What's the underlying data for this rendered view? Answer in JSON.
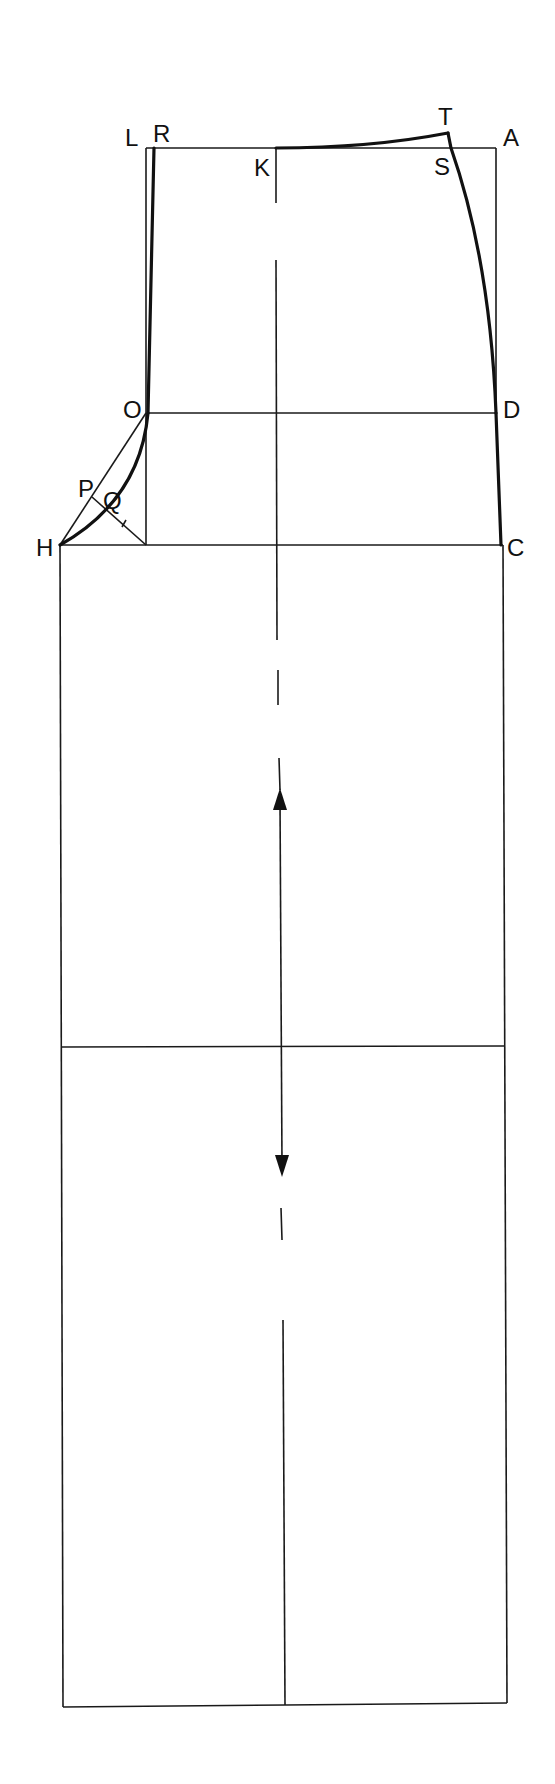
{
  "diagram": {
    "type": "pattern-draft",
    "colors": {
      "line": "#1a1a1a",
      "background": "#ffffff"
    },
    "points": {
      "L": {
        "label": "L",
        "x": 148,
        "y": 148
      },
      "R": {
        "label": "R",
        "x": 155,
        "y": 148
      },
      "K": {
        "label": "K",
        "x": 276,
        "y": 148
      },
      "T": {
        "label": "T",
        "x": 448,
        "y": 133
      },
      "S": {
        "label": "S",
        "x": 451,
        "y": 148
      },
      "A": {
        "label": "A",
        "x": 496,
        "y": 148
      },
      "O": {
        "label": "O",
        "x": 148,
        "y": 413
      },
      "D": {
        "label": "D",
        "x": 496,
        "y": 413
      },
      "P": {
        "label": "P",
        "x": 92,
        "y": 497
      },
      "Q": {
        "label": "Q",
        "x": 108,
        "y": 509
      },
      "H": {
        "label": "H",
        "x": 60,
        "y": 545
      },
      "C": {
        "label": "C",
        "x": 501,
        "y": 545
      }
    },
    "labels": [
      "L",
      "R",
      "K",
      "T",
      "S",
      "A",
      "O",
      "D",
      "P",
      "Q",
      "H",
      "C"
    ],
    "grainline": {
      "symbol": "double-arrow",
      "x": 281,
      "y_top": 790,
      "y_bottom": 1175
    }
  }
}
